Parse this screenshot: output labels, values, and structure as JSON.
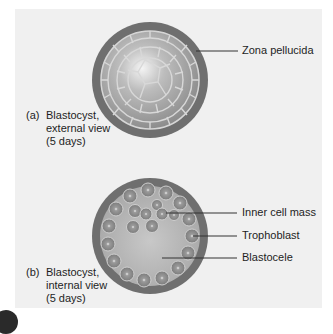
{
  "figure": {
    "panel_a": {
      "caption_tag": "(a)",
      "caption_lines": [
        "Blastocyst,",
        "external view",
        "(5 days)"
      ],
      "labels": [
        {
          "text": "Zona pellucida"
        }
      ]
    },
    "panel_b": {
      "caption_tag": "(b)",
      "caption_lines": [
        "Blastocyst,",
        "internal view",
        "(5 days)"
      ],
      "labels": [
        {
          "text": "Inner cell mass"
        },
        {
          "text": "Trophoblast"
        },
        {
          "text": "Blastocele"
        }
      ]
    },
    "colors": {
      "background_panel": "#f0f0f0",
      "zona_pellucida": "#6f6f6f",
      "cell_fill": "#8c8c8c",
      "cell_border": "#cfcfcf",
      "leader_line": "#333333"
    }
  }
}
